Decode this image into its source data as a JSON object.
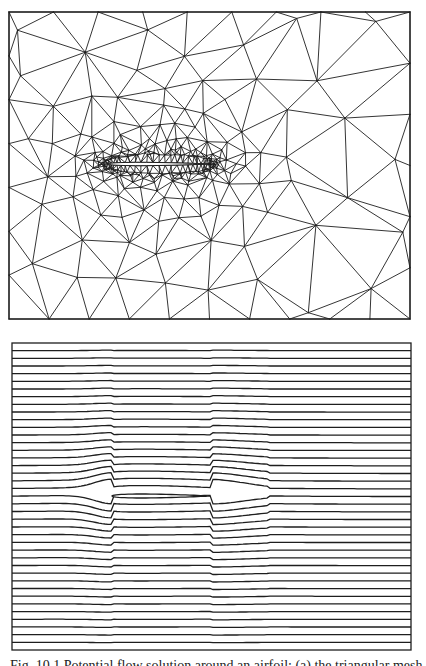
{
  "figure": {
    "caption": "Fig. 10.1  Potential flow solution around an airfoil: (a) the triangular mesh, (b) streamlines"
  },
  "colors": {
    "ink": "#1e1e1e",
    "background": "#ffffff"
  },
  "mesh_panel": {
    "label": "triangular-mesh",
    "frame": {
      "x0": 9,
      "y0": 12,
      "x1": 410,
      "y1": 319
    },
    "airfoil": {
      "leading_x": 108,
      "trailing_x": 210,
      "chord_y": 164,
      "thickness": 10
    },
    "seed": 7,
    "rings": 9,
    "ring_growth": 1.55,
    "far_points": 60
  },
  "flow_panel": {
    "label": "streamlines",
    "frame": {
      "x0": 12,
      "y0": 343,
      "x1": 411,
      "y1": 650
    },
    "airfoil": {
      "leading_x": 112,
      "trailing_x": 210,
      "chord_y": 496,
      "thickness": 12
    },
    "line_count": 41
  }
}
